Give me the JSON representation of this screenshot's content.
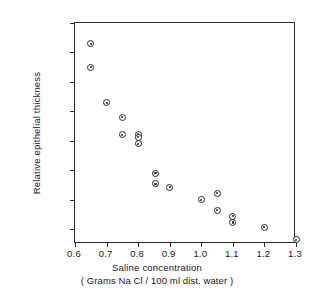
{
  "chart_data": {
    "type": "scatter",
    "title": "",
    "xlabel": "Saline concentration",
    "xlabel_line2": "( Grams Na Cl / 100 ml dist. water )",
    "ylabel": "Relative epithelial thickness",
    "xlim": [
      0.6,
      1.3
    ],
    "ylim": [
      85,
      160
    ],
    "grid": false,
    "legend": null,
    "marker": "circle-with-center-dot",
    "xticks": [
      0.6,
      0.7,
      0.8,
      0.9,
      1.0,
      1.1,
      1.2,
      1.3
    ],
    "xtick_labels": [
      "0.6",
      "0.7",
      "0.8",
      "0.9",
      "1.0",
      "1.1",
      "1.2",
      "1.3"
    ],
    "yticks": [
      90,
      100,
      110,
      120,
      130,
      140,
      150,
      160
    ],
    "ytick_labels": [
      "90",
      "100",
      "110",
      "120",
      "130",
      "140",
      "150",
      "160"
    ],
    "points": [
      {
        "x": 0.65,
        "y": 153.0
      },
      {
        "x": 0.65,
        "y": 145.0
      },
      {
        "x": 0.7,
        "y": 133.0
      },
      {
        "x": 0.75,
        "y": 128.0
      },
      {
        "x": 0.75,
        "y": 122.0
      },
      {
        "x": 0.8,
        "y": 122.3
      },
      {
        "x": 0.8,
        "y": 121.3
      },
      {
        "x": 0.8,
        "y": 119.0
      },
      {
        "x": 0.855,
        "y": 109.0
      },
      {
        "x": 0.855,
        "y": 105.5
      },
      {
        "x": 0.9,
        "y": 104.3
      },
      {
        "x": 1.0,
        "y": 100.0
      },
      {
        "x": 1.05,
        "y": 102.2
      },
      {
        "x": 1.05,
        "y": 96.5
      },
      {
        "x": 1.1,
        "y": 94.5
      },
      {
        "x": 1.1,
        "y": 92.3
      },
      {
        "x": 1.2,
        "y": 90.7
      },
      {
        "x": 1.3,
        "y": 86.5
      }
    ]
  },
  "axis": {
    "frame_color": "#2b2b2b",
    "marker_color": "#262626",
    "background": "#ffffff"
  }
}
